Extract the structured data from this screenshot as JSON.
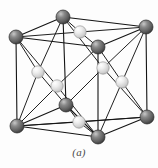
{
  "figure": {
    "caption": "(a)",
    "background_color": "#fdfdfd"
  },
  "diagram": {
    "type": "crystal-lattice-unit-cell",
    "lattice": "face-centered cubic",
    "edge_color": "#141414",
    "edge_width": 1.1,
    "corner_atom": {
      "label": "corner-atom",
      "radius": 7.0,
      "fill_color": "#6e6e6e",
      "shade_dark": "#3a3a3a",
      "highlight_color": "#c8c8c8",
      "outline_color": "#2a2a2a",
      "count": 8
    },
    "face_atom": {
      "label": "face-center-atom",
      "radius": 6.2,
      "fill_color": "#e2e2e2",
      "shade_dark": "#b4b4b4",
      "highlight_color": "#ffffff",
      "outline_color": "#9a9a9a",
      "count": 6
    },
    "corner_atoms": [
      {
        "id": "back-top-left",
        "x": 16,
        "y": 37
      },
      {
        "id": "back-top-center",
        "x": 63,
        "y": 17
      },
      {
        "id": "back-top-right",
        "x": 146,
        "y": 27
      },
      {
        "id": "front-top-right",
        "x": 98,
        "y": 47
      },
      {
        "id": "back-bottom-left",
        "x": 17,
        "y": 126
      },
      {
        "id": "front-bottom-left",
        "x": 66,
        "y": 105
      },
      {
        "id": "back-bottom-right",
        "x": 147,
        "y": 117
      },
      {
        "id": "front-bottom-right",
        "x": 98,
        "y": 137
      }
    ],
    "face_atoms": [
      {
        "id": "top-face",
        "x": 80,
        "y": 32
      },
      {
        "id": "left-face",
        "x": 38,
        "y": 72
      },
      {
        "id": "front-face",
        "x": 57,
        "y": 86
      },
      {
        "id": "back-face",
        "x": 103,
        "y": 68
      },
      {
        "id": "right-face",
        "x": 122,
        "y": 82
      },
      {
        "id": "bottom-face",
        "x": 79,
        "y": 122
      }
    ],
    "cube_edges": [
      [
        "back-top-left",
        "back-top-center"
      ],
      [
        "back-top-center",
        "back-top-right"
      ],
      [
        "back-top-left",
        "front-top-right"
      ],
      [
        "front-top-right",
        "back-top-right"
      ],
      [
        "back-bottom-left",
        "front-bottom-left"
      ],
      [
        "front-bottom-left",
        "front-bottom-right"
      ],
      [
        "back-bottom-left",
        "front-bottom-right"
      ],
      [
        "front-bottom-right",
        "back-bottom-right"
      ],
      [
        "back-bottom-left",
        "back-bottom-right"
      ],
      [
        "back-top-left",
        "back-bottom-left"
      ],
      [
        "back-top-center",
        "front-bottom-left"
      ],
      [
        "back-top-right",
        "back-bottom-right"
      ],
      [
        "front-top-right",
        "front-bottom-right"
      ]
    ]
  }
}
